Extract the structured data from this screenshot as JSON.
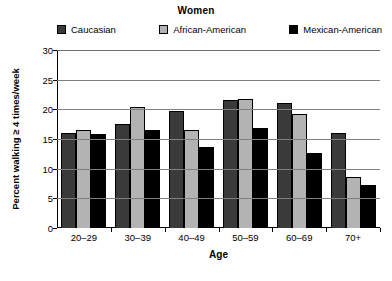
{
  "chart_data": {
    "type": "bar",
    "title": "Women",
    "xlabel": "Age",
    "ylabel": "Percent walking ≥ 4 times/week",
    "categories": [
      "20–29",
      "30–39",
      "40–49",
      "50–59",
      "60–69",
      "70+"
    ],
    "ylim": [
      0,
      30
    ],
    "yticks": [
      0,
      5,
      10,
      15,
      20,
      25,
      30
    ],
    "grid": "horizontal",
    "legend_position": "top",
    "series": [
      {
        "name": "Caucasian",
        "color": "#3a3a3a",
        "values": [
          16.0,
          17.6,
          19.8,
          21.5,
          21.0,
          16.0
        ]
      },
      {
        "name": "African-American",
        "color": "#b3b3b3",
        "values": [
          16.5,
          20.4,
          16.5,
          21.7,
          19.2,
          8.6
        ]
      },
      {
        "name": "Mexican-American",
        "color": "#000000",
        "values": [
          15.8,
          16.6,
          13.7,
          16.8,
          12.7,
          7.2
        ]
      }
    ]
  }
}
